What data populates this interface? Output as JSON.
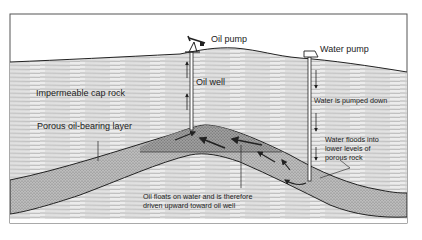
{
  "diagram": {
    "labels": {
      "oil_pump": "Oil pump",
      "water_pump": "Water pump",
      "oil_well": "Oil well",
      "cap_rock": "Impermeable cap rock",
      "porous_layer": "Porous oil-bearing layer",
      "water_pumped_down": "Water is pumped down",
      "water_floods_1": "Water floods into",
      "water_floods_2": "lower levels of",
      "water_floods_3": "porous rock",
      "oil_floats_1": "Oil floats on water and is therefore",
      "oil_floats_2": "driven upward toward oil well"
    },
    "colors": {
      "frame": "#555555",
      "sky": "#ffffff",
      "rock_lines": "#9a9a9a",
      "porous_fill": "#b5b5b5",
      "oil_zone_fill": "#8e8e8e",
      "outline": "#222222"
    }
  }
}
